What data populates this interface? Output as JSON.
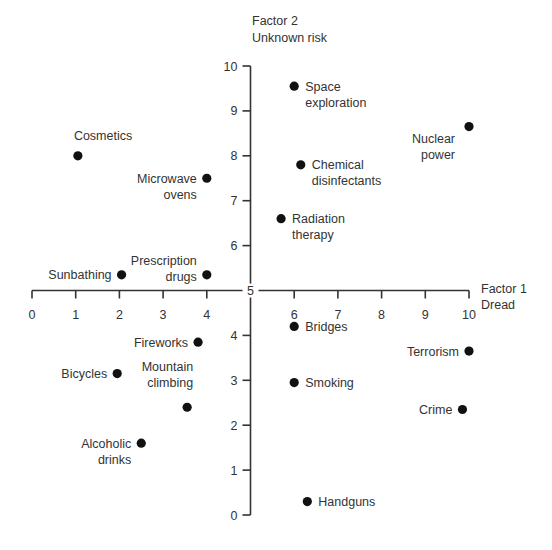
{
  "chart_data": {
    "type": "scatter",
    "title": "",
    "xlabel": "Factor 1 Dread",
    "xlabel_lines": [
      "Factor 1",
      "Dread"
    ],
    "ylabel": "Factor 2 Unknown risk",
    "ylabel_lines": [
      "Factor 2",
      "Unknown risk"
    ],
    "xlim": [
      0,
      10
    ],
    "ylim": [
      0,
      10
    ],
    "x_ticks": [
      0,
      1,
      2,
      3,
      4,
      5,
      6,
      7,
      8,
      9,
      10
    ],
    "y_ticks": [
      0,
      1,
      2,
      3,
      4,
      5,
      6,
      7,
      8,
      9,
      10
    ],
    "axes_cross_at": {
      "x": 5,
      "y": 5
    },
    "grid": false,
    "legend": null,
    "points": [
      {
        "label": "Space exploration",
        "lines": [
          "Space",
          "exploration"
        ],
        "x": 6.0,
        "y": 9.55,
        "label_side": "right"
      },
      {
        "label": "Nuclear power",
        "lines": [
          "Nuclear",
          "power"
        ],
        "x": 10.0,
        "y": 8.65,
        "label_side": "below-left"
      },
      {
        "label": "Cosmetics",
        "lines": [
          "Cosmetics"
        ],
        "x": 1.05,
        "y": 8.0,
        "label_side": "above"
      },
      {
        "label": "Chemical disinfectants",
        "lines": [
          "Chemical",
          "disinfectants"
        ],
        "x": 6.15,
        "y": 7.8,
        "label_side": "right"
      },
      {
        "label": "Microwave ovens",
        "lines": [
          "Microwave",
          "ovens"
        ],
        "x": 4.0,
        "y": 7.5,
        "label_side": "left"
      },
      {
        "label": "Radiation therapy",
        "lines": [
          "Radiation",
          "therapy"
        ],
        "x": 5.7,
        "y": 6.6,
        "label_side": "right"
      },
      {
        "label": "Sunbathing",
        "lines": [
          "Sunbathing"
        ],
        "x": 2.05,
        "y": 5.35,
        "label_side": "left"
      },
      {
        "label": "Prescription drugs",
        "lines": [
          "Prescription",
          "drugs"
        ],
        "x": 4.0,
        "y": 5.35,
        "label_side": "left-up"
      },
      {
        "label": "Bridges",
        "lines": [
          "Bridges"
        ],
        "x": 6.0,
        "y": 4.2,
        "label_side": "right"
      },
      {
        "label": "Fireworks",
        "lines": [
          "Fireworks"
        ],
        "x": 3.8,
        "y": 3.85,
        "label_side": "left"
      },
      {
        "label": "Terrorism",
        "lines": [
          "Terrorism"
        ],
        "x": 10.0,
        "y": 3.65,
        "label_side": "left"
      },
      {
        "label": "Bicycles",
        "lines": [
          "Bicycles"
        ],
        "x": 1.95,
        "y": 3.15,
        "label_side": "left"
      },
      {
        "label": "Smoking",
        "lines": [
          "Smoking"
        ],
        "x": 6.0,
        "y": 2.95,
        "label_side": "right"
      },
      {
        "label": "Mountain climbing",
        "lines": [
          "Mountain",
          "climbing"
        ],
        "x": 3.55,
        "y": 2.4,
        "label_side": "above-left"
      },
      {
        "label": "Crime",
        "lines": [
          "Crime"
        ],
        "x": 9.85,
        "y": 2.35,
        "label_side": "left"
      },
      {
        "label": "Alcoholic drinks",
        "lines": [
          "Alcoholic",
          "drinks"
        ],
        "x": 2.5,
        "y": 1.6,
        "label_side": "left"
      },
      {
        "label": "Handguns",
        "lines": [
          "Handguns"
        ],
        "x": 6.3,
        "y": 0.3,
        "label_side": "right"
      }
    ]
  },
  "colors": {
    "axis": "#333333",
    "point": "#111111",
    "text": "#333333",
    "background": "#ffffff"
  }
}
